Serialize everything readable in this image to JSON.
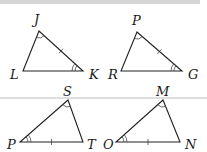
{
  "figure": {
    "type": "congruent-triangle-pairs",
    "colors": {
      "stroke": "#222222",
      "marks": "#444444",
      "separator": "#bdbdbd",
      "band": "#d6d6d6"
    },
    "triangles": [
      {
        "name": "JLK",
        "vertices": {
          "J": [
            39,
            31
          ],
          "L": [
            23,
            71
          ],
          "K": [
            83,
            71
          ]
        },
        "labels": [
          {
            "text": "J",
            "x": 34,
            "y": 24
          },
          {
            "text": "L",
            "x": 10,
            "y": 79
          },
          {
            "text": "K",
            "x": 89,
            "y": 79
          }
        ],
        "single_arc_at": "J",
        "double_arc_at": "K",
        "tick_on": "JK"
      },
      {
        "name": "PRG",
        "vertices": {
          "P": [
            137,
            32
          ],
          "R": [
            121,
            71
          ],
          "G": [
            182,
            71
          ]
        },
        "labels": [
          {
            "text": "P",
            "x": 132,
            "y": 25
          },
          {
            "text": "R",
            "x": 108,
            "y": 79
          },
          {
            "text": "G",
            "x": 188,
            "y": 79
          }
        ],
        "single_arc_at": "P",
        "double_arc_at": "G",
        "tick_on": "PG"
      },
      {
        "name": "SPT",
        "vertices": {
          "S": [
            68,
            100
          ],
          "P": [
            20,
            142
          ],
          "T": [
            83,
            142
          ]
        },
        "labels": [
          {
            "text": "S",
            "x": 63,
            "y": 96
          },
          {
            "text": "P",
            "x": 7,
            "y": 149
          },
          {
            "text": "T",
            "x": 87,
            "y": 149
          }
        ],
        "single_arc_at": "S",
        "double_arc_at": "P",
        "tick_on": "PT"
      },
      {
        "name": "MON",
        "vertices": {
          "M": [
            163,
            100
          ],
          "O": [
            116,
            142
          ],
          "N": [
            180,
            142
          ]
        },
        "labels": [
          {
            "text": "M",
            "x": 156,
            "y": 96
          },
          {
            "text": "O",
            "x": 103,
            "y": 149
          },
          {
            "text": "N",
            "x": 185,
            "y": 149
          }
        ],
        "single_arc_at": "M",
        "double_arc_at": "O",
        "tick_on": "ON"
      }
    ],
    "separator_y": 98
  }
}
